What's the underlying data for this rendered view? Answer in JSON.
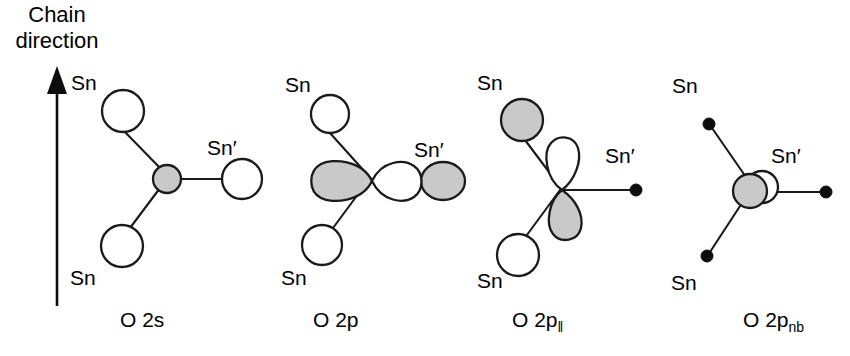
{
  "figure": {
    "background_color": "#ffffff",
    "stroke_color": "#1a1a1a",
    "shaded_fill": "#c9c9c9",
    "open_fill": "#ffffff",
    "width": 850,
    "height": 356
  },
  "axis": {
    "label_line1": "Chain",
    "label_line2": "direction",
    "arrow_direction": "up"
  },
  "panels": [
    {
      "id": "panel-o2s",
      "caption_main": "O 2s",
      "caption_sub": "",
      "center_orbital": "s-sphere-shaded",
      "neighbors": [
        {
          "label": "Sn",
          "prime": false,
          "marker": "circle-open",
          "position": "upper-left"
        },
        {
          "label": "Sn",
          "prime": false,
          "marker": "circle-open",
          "position": "lower-left"
        },
        {
          "label": "Sn′",
          "prime": true,
          "marker": "circle-open",
          "position": "right"
        }
      ]
    },
    {
      "id": "panel-o2p",
      "caption_main": "O 2p",
      "caption_sub": "",
      "center_orbital": "p-dumbbell-horizontal",
      "neighbors": [
        {
          "label": "Sn",
          "prime": false,
          "marker": "circle-open",
          "position": "upper-left"
        },
        {
          "label": "Sn",
          "prime": false,
          "marker": "circle-open",
          "position": "lower-left"
        },
        {
          "label": "Sn′",
          "prime": true,
          "marker": "ellipse-shaded",
          "position": "right"
        }
      ]
    },
    {
      "id": "panel-o2p-par",
      "caption_main": "O 2p",
      "caption_sub": "‖",
      "center_orbital": "p-dumbbell-vertical",
      "neighbors": [
        {
          "label": "Sn",
          "prime": false,
          "marker": "circle-shaded",
          "position": "upper-left"
        },
        {
          "label": "Sn",
          "prime": false,
          "marker": "circle-open",
          "position": "lower-left"
        },
        {
          "label": "Sn′",
          "prime": true,
          "marker": "dot",
          "position": "right"
        }
      ]
    },
    {
      "id": "panel-o2p-nb",
      "caption_main": "O 2p",
      "caption_sub": "nb",
      "center_orbital": "two-overlapping-spheres",
      "neighbors": [
        {
          "label": "Sn",
          "prime": false,
          "marker": "dot",
          "position": "upper-left"
        },
        {
          "label": "Sn",
          "prime": false,
          "marker": "dot",
          "position": "lower-left"
        },
        {
          "label": "Sn′",
          "prime": true,
          "marker": "dot",
          "position": "right"
        }
      ]
    }
  ]
}
